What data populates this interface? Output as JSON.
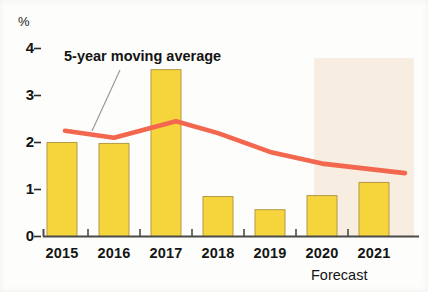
{
  "chart_data": {
    "type": "bar",
    "title": "",
    "subtitle": "",
    "xlabel": "",
    "ylabel": "%",
    "categories": [
      "2015",
      "2016",
      "2017",
      "2018",
      "2019",
      "2020",
      "2021"
    ],
    "values": [
      2.0,
      1.98,
      3.55,
      0.85,
      0.57,
      0.87,
      1.15
    ],
    "series": [
      {
        "name": "Annual value",
        "type": "bar",
        "values": [
          2.0,
          1.98,
          3.55,
          0.85,
          0.57,
          0.87,
          1.15
        ],
        "color": "#F6D43C"
      },
      {
        "name": "5-year moving average",
        "type": "line",
        "values": [
          2.25,
          2.1,
          2.45,
          2.2,
          1.8,
          1.55,
          1.35
        ],
        "color": "#F2674E"
      }
    ],
    "ylim": [
      0,
      4.3
    ],
    "yticks": [
      0,
      1,
      2,
      3,
      4
    ],
    "ytick_labels": [
      "0",
      "1",
      "2",
      "3",
      "4"
    ],
    "grid": false,
    "legend": "none",
    "annotations": [
      {
        "text": "5-year moving average",
        "target_series": "5-year moving average",
        "has_leader_line": true
      },
      {
        "text": "Forecast",
        "region": "2020-2021",
        "shaded": true
      }
    ],
    "shaded_region": {
      "label": "Forecast",
      "from_category": "2020",
      "to_category": "2021",
      "color": "#F7EDE0"
    },
    "bar_color": "#F6D43C",
    "bar_edge_color": "#B39A46",
    "line_color": "#F2674E",
    "axis_color": "#4A4A48",
    "background_color": "#FDFDFB"
  },
  "axis": {
    "unit_label": "%",
    "y_ticks": [
      "4",
      "3",
      "2",
      "1",
      "0"
    ],
    "x_ticks": [
      "2015",
      "2016",
      "2017",
      "2018",
      "2019",
      "2020",
      "2021"
    ]
  },
  "labels": {
    "moving_average": "5-year moving average",
    "forecast": "Forecast"
  }
}
